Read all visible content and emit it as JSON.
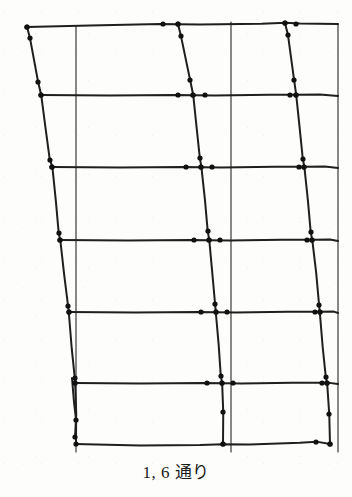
{
  "figure": {
    "caption": "1, 6 通り",
    "kind": "structural-frame-deformation-diagram",
    "colors": {
      "ink": "#1f1f1f",
      "grid": "#3a3a3a",
      "paper": "#fdfdfc",
      "joint": "#111111"
    },
    "line_widths": {
      "member": 2.0,
      "grid": 1.2
    },
    "joint_marker_radius": 2.6
  },
  "geometry": {
    "reference_grid": {
      "verticals": [
        {
          "name": "grid-line-left",
          "x": 76,
          "y1": 26,
          "y2": 452
        },
        {
          "name": "grid-line-middle",
          "x": 231,
          "y1": 22,
          "y2": 452
        },
        {
          "name": "grid-line-right",
          "x": 338,
          "y1": 24,
          "y2": 452
        }
      ],
      "horizontals": []
    },
    "columns": [
      {
        "name": "column-left",
        "points": [
          [
            27,
            27
          ],
          [
            30,
            38
          ],
          [
            38,
            82
          ],
          [
            41,
            95
          ],
          [
            46,
            129
          ],
          [
            50,
            160
          ],
          [
            52,
            167
          ],
          [
            56,
            202
          ],
          [
            59,
            233
          ],
          [
            60,
            240
          ],
          [
            64,
            275
          ],
          [
            68,
            306
          ],
          [
            69,
            312
          ],
          [
            72,
            348
          ],
          [
            75,
            378
          ],
          [
            75,
            383
          ],
          [
            76,
            414
          ],
          [
            75,
            437
          ]
        ],
        "joints": [
          [
            27,
            27
          ],
          [
            30,
            38
          ],
          [
            38,
            82
          ],
          [
            41,
            95
          ],
          [
            50,
            160
          ],
          [
            52,
            167
          ],
          [
            59,
            233
          ],
          [
            60,
            240
          ],
          [
            68,
            306
          ],
          [
            69,
            312
          ],
          [
            75,
            378
          ],
          [
            75,
            383
          ],
          [
            75,
            437
          ]
        ]
      },
      {
        "name": "column-left-lower-branch",
        "points": [
          [
            72,
            378
          ],
          [
            74,
            402
          ],
          [
            76,
            420
          ],
          [
            76,
            444
          ]
        ],
        "joints": [
          [
            76,
            420
          ],
          [
            76,
            444
          ]
        ]
      },
      {
        "name": "column-middle",
        "points": [
          [
            178,
            24
          ],
          [
            181,
            36
          ],
          [
            190,
            80
          ],
          [
            193,
            95
          ],
          [
            197,
            128
          ],
          [
            200,
            158
          ],
          [
            201,
            167
          ],
          [
            205,
            200
          ],
          [
            208,
            231
          ],
          [
            209,
            240
          ],
          [
            212,
            272
          ],
          [
            215,
            304
          ],
          [
            216,
            312
          ],
          [
            219,
            345
          ],
          [
            221,
            376
          ],
          [
            222,
            383
          ],
          [
            223,
            412
          ],
          [
            223,
            444
          ]
        ],
        "joints": [
          [
            178,
            24
          ],
          [
            181,
            36
          ],
          [
            190,
            80
          ],
          [
            193,
            95
          ],
          [
            200,
            158
          ],
          [
            201,
            167
          ],
          [
            208,
            231
          ],
          [
            209,
            240
          ],
          [
            215,
            304
          ],
          [
            216,
            312
          ],
          [
            221,
            376
          ],
          [
            222,
            383
          ],
          [
            223,
            412
          ],
          [
            223,
            444
          ]
        ]
      },
      {
        "name": "column-right",
        "points": [
          [
            285,
            23
          ],
          [
            288,
            35
          ],
          [
            294,
            80
          ],
          [
            296,
            95
          ],
          [
            300,
            128
          ],
          [
            303,
            159
          ],
          [
            304,
            167
          ],
          [
            308,
            201
          ],
          [
            311,
            232
          ],
          [
            312,
            240
          ],
          [
            316,
            273
          ],
          [
            319,
            305
          ],
          [
            320,
            312
          ],
          [
            323,
            347
          ],
          [
            326,
            377
          ],
          [
            327,
            383
          ],
          [
            329,
            414
          ],
          [
            330,
            444
          ]
        ],
        "joints": [
          [
            285,
            23
          ],
          [
            288,
            35
          ],
          [
            294,
            80
          ],
          [
            296,
            95
          ],
          [
            303,
            159
          ],
          [
            304,
            167
          ],
          [
            311,
            232
          ],
          [
            312,
            240
          ],
          [
            319,
            305
          ],
          [
            320,
            312
          ],
          [
            326,
            377
          ],
          [
            327,
            383
          ],
          [
            329,
            414
          ],
          [
            330,
            444
          ]
        ]
      }
    ],
    "beams": [
      {
        "name": "beam-level-1-roof",
        "points": [
          [
            27,
            27
          ],
          [
            90,
            25
          ],
          [
            160,
            24
          ],
          [
            178,
            24
          ],
          [
            200,
            24
          ],
          [
            262,
            24
          ],
          [
            285,
            23
          ],
          [
            300,
            24
          ],
          [
            338,
            24
          ]
        ],
        "joints": [
          [
            27,
            27
          ],
          [
            163,
            24
          ],
          [
            178,
            24
          ],
          [
            285,
            23
          ],
          [
            296,
            24
          ]
        ]
      },
      {
        "name": "beam-level-2",
        "points": [
          [
            41,
            95
          ],
          [
            110,
            95
          ],
          [
            175,
            95
          ],
          [
            193,
            95
          ],
          [
            215,
            95
          ],
          [
            270,
            95
          ],
          [
            296,
            95
          ],
          [
            320,
            95
          ],
          [
            338,
            96
          ]
        ],
        "joints": [
          [
            41,
            95
          ],
          [
            178,
            95
          ],
          [
            193,
            95
          ],
          [
            205,
            95
          ],
          [
            290,
            95
          ],
          [
            296,
            95
          ]
        ]
      },
      {
        "name": "beam-level-3",
        "points": [
          [
            52,
            167
          ],
          [
            120,
            167
          ],
          [
            183,
            167
          ],
          [
            201,
            167
          ],
          [
            222,
            167
          ],
          [
            275,
            167
          ],
          [
            304,
            167
          ],
          [
            325,
            167
          ],
          [
            338,
            168
          ]
        ],
        "joints": [
          [
            52,
            167
          ],
          [
            186,
            167
          ],
          [
            201,
            167
          ],
          [
            212,
            167
          ],
          [
            299,
            167
          ],
          [
            304,
            167
          ]
        ]
      },
      {
        "name": "beam-level-4",
        "points": [
          [
            60,
            240
          ],
          [
            128,
            240
          ],
          [
            191,
            240
          ],
          [
            209,
            240
          ],
          [
            230,
            240
          ],
          [
            282,
            240
          ],
          [
            312,
            240
          ],
          [
            330,
            240
          ],
          [
            338,
            241
          ]
        ],
        "joints": [
          [
            60,
            240
          ],
          [
            194,
            240
          ],
          [
            209,
            240
          ],
          [
            220,
            240
          ],
          [
            307,
            240
          ],
          [
            312,
            240
          ]
        ]
      },
      {
        "name": "beam-level-5",
        "points": [
          [
            69,
            312
          ],
          [
            135,
            312
          ],
          [
            198,
            312
          ],
          [
            216,
            312
          ],
          [
            236,
            312
          ],
          [
            288,
            312
          ],
          [
            320,
            312
          ],
          [
            334,
            312
          ],
          [
            338,
            313
          ]
        ],
        "joints": [
          [
            69,
            312
          ],
          [
            201,
            312
          ],
          [
            216,
            312
          ],
          [
            227,
            312
          ],
          [
            315,
            312
          ],
          [
            320,
            312
          ]
        ]
      },
      {
        "name": "beam-level-6",
        "points": [
          [
            75,
            383
          ],
          [
            140,
            383
          ],
          [
            204,
            383
          ],
          [
            222,
            383
          ],
          [
            242,
            383
          ],
          [
            293,
            383
          ],
          [
            327,
            383
          ],
          [
            338,
            384
          ]
        ],
        "joints": [
          [
            75,
            383
          ],
          [
            207,
            383
          ],
          [
            222,
            383
          ],
          [
            233,
            383
          ],
          [
            322,
            383
          ],
          [
            327,
            383
          ]
        ]
      },
      {
        "name": "beam-level-7-base",
        "points": [
          [
            75,
            444
          ],
          [
            140,
            445
          ],
          [
            200,
            445
          ],
          [
            223,
            444
          ],
          [
            250,
            444
          ],
          [
            300,
            443
          ],
          [
            316,
            442
          ],
          [
            330,
            444
          ]
        ],
        "joints": [
          [
            223,
            444
          ],
          [
            316,
            442
          ],
          [
            330,
            444
          ]
        ]
      }
    ]
  }
}
